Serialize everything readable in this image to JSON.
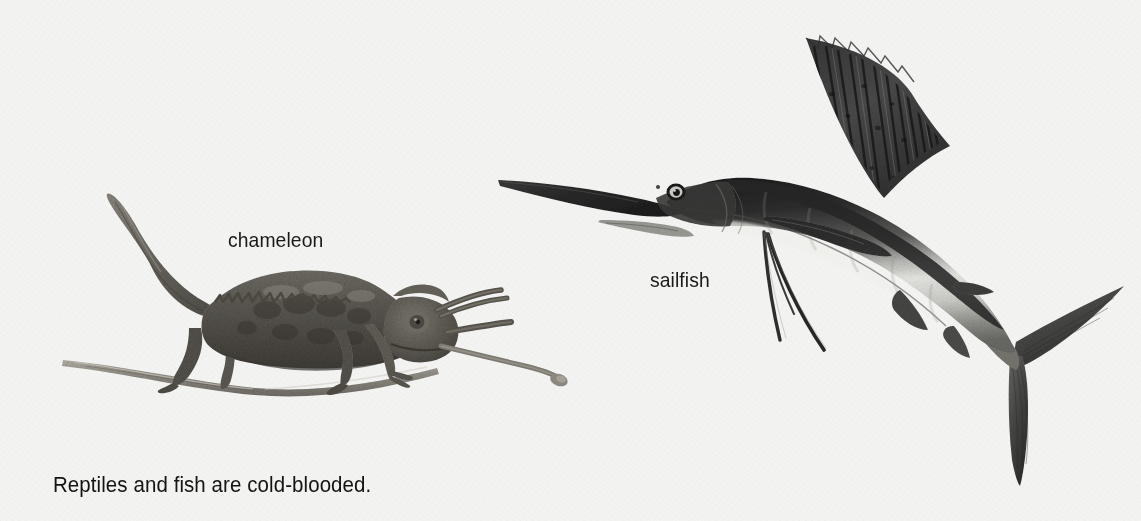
{
  "page": {
    "background_color": "#f3f3f1",
    "width": 1141,
    "height": 521,
    "kind": "textbook-illustration-plate"
  },
  "caption": {
    "text": "Reptiles and fish are cold-blooded."
  },
  "figures": [
    {
      "id": "chameleon",
      "label": "chameleon",
      "subject": "Jackson's chameleon perched on a branch with tongue extended",
      "details": {
        "horns": 3,
        "pose": "standing on branch, facing right, tail curled up and back",
        "tongue": "extended to the right ending in a club-shaped tip",
        "support": "thin branch running left to right beneath the feet"
      },
      "colors": {
        "body_dark": "#4c4a46",
        "body_mid": "#6e6b64",
        "body_light": "#9a968d",
        "branch": "#8b877d"
      }
    },
    {
      "id": "sailfish",
      "label": "sailfish",
      "subject": "sailfish leaping, bill pointing left, tall sail-like dorsal fin raised",
      "details": {
        "bill": "long pointed rostrum pointing to the upper left",
        "dorsal_fin": "tall fan-shaped sail with many vertical rays and spotted membrane",
        "pelvic_filaments": 2,
        "tail": "deeply forked crescent caudal fin at lower right",
        "body_pattern": "dark blue-black back fading to silvery white belly"
      },
      "colors": {
        "back_dark": "#2b2b2b",
        "mid_gray": "#7b7b7b",
        "belly_light": "#e8e8e6",
        "fin_dark": "#3a3a3a"
      }
    }
  ],
  "labels": {
    "chameleon": "chameleon",
    "sailfish": "sailfish"
  }
}
